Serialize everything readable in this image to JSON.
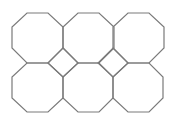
{
  "diagram": {
    "type": "tiling",
    "stroke_color": "#7a7a7a",
    "background": "#ffffff",
    "stroke_width": 1.2,
    "octagons": [
      {
        "id": "octagon-r1c1",
        "points": "27,13 48,13 63,27 63,48 48,63 27,63 12,48 12,27"
      },
      {
        "id": "octagon-r1c2",
        "points": "78,13 99,13 114,27 114,48 99,63 78,63 63,48 63,27"
      },
      {
        "id": "octagon-r1c3",
        "points": "128,13 149,13 164,27 164,48 149,63 128,63 113,48 113,27"
      },
      {
        "id": "octagon-r2c1",
        "points": "27,63 48,63 63,77 63,98 48,112 27,112 12,98 12,77"
      },
      {
        "id": "octagon-r2c2",
        "points": "78,63 99,63 113,77 113,98 99,112 78,112 63,98 63,77"
      },
      {
        "id": "octagon-r2c3",
        "points": "128,63 149,63 163,77 163,98 149,112 128,112 113,98 113,77"
      }
    ],
    "squares": [
      {
        "id": "square-1",
        "points": "63,48 78,63 63,77 48,63"
      },
      {
        "id": "square-2",
        "points": "113,48 128,63 113,77 98,63"
      }
    ]
  }
}
